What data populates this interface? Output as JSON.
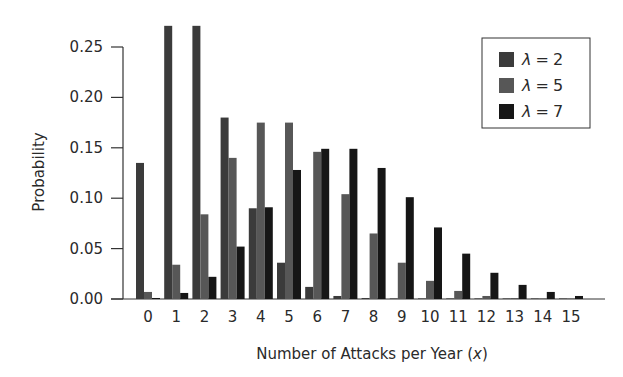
{
  "chart_data": {
    "type": "bar",
    "title": "",
    "xlabel": "Number of Attacks per Year (x)",
    "xlabel_main": "Number of Attacks per Year (",
    "xlabel_var": "x",
    "xlabel_close": ")",
    "ylabel": "Probability",
    "ylim": [
      0,
      0.28
    ],
    "yticks": [
      0.0,
      0.05,
      0.1,
      0.15,
      0.2,
      0.25
    ],
    "ytick_labels": [
      "0.00",
      "0.05",
      "0.10",
      "0.15",
      "0.20",
      "0.25"
    ],
    "categories": [
      "0",
      "1",
      "2",
      "3",
      "4",
      "5",
      "6",
      "7",
      "8",
      "9",
      "10",
      "11",
      "12",
      "13",
      "14",
      "15"
    ],
    "grid": false,
    "legend_position": "upper right",
    "series": [
      {
        "name": "λ = 2",
        "color": "#3b3b3b",
        "values": [
          0.135,
          0.271,
          0.271,
          0.18,
          0.09,
          0.036,
          0.012,
          0.003,
          0.001,
          0.0,
          0.0,
          0.0,
          0.0,
          0.0,
          0.0,
          0.0
        ]
      },
      {
        "name": "λ = 5",
        "color": "#575757",
        "values": [
          0.007,
          0.034,
          0.084,
          0.14,
          0.175,
          0.175,
          0.146,
          0.104,
          0.065,
          0.036,
          0.018,
          0.008,
          0.003,
          0.001,
          0.0,
          0.0
        ]
      },
      {
        "name": "λ = 7",
        "color": "#161616",
        "values": [
          0.001,
          0.006,
          0.022,
          0.052,
          0.091,
          0.128,
          0.149,
          0.149,
          0.13,
          0.101,
          0.071,
          0.045,
          0.026,
          0.014,
          0.007,
          0.003
        ]
      }
    ]
  },
  "legend": {
    "items": [
      {
        "symbol": "λ",
        "eq": "=",
        "value": "2"
      },
      {
        "symbol": "λ",
        "eq": "=",
        "value": "5"
      },
      {
        "symbol": "λ",
        "eq": "=",
        "value": "7"
      }
    ]
  }
}
